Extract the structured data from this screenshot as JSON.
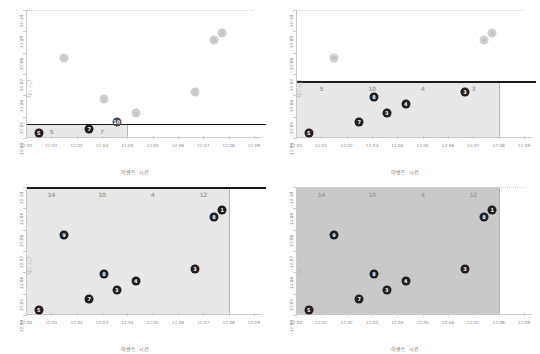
{
  "figure": {
    "panel_count": 4,
    "xlabel": "이벤트 시간",
    "ylabel": "처리 시간",
    "x_ticks": [
      "12:00",
      "12:01",
      "12:02",
      "12:03",
      "12:04",
      "12:05",
      "12:06",
      "12:07",
      "12:08",
      "12:09"
    ],
    "y_ticks": [
      "12:04",
      "12:05",
      "12:06",
      "12:07",
      "12:08",
      "12:09",
      "12:10"
    ],
    "group_labels": [
      "14",
      "10",
      "4",
      "12"
    ],
    "group_labels_partial": [
      "5",
      "10",
      "4",
      "3"
    ],
    "group_labels_tl": [
      "5",
      "7"
    ]
  },
  "chart_data": [
    {
      "type": "scatter",
      "panel": "top-left",
      "title": "",
      "xlabel": "이벤트 시간",
      "ylabel": "처리 시간",
      "xlim": [
        "12:00",
        "12:09"
      ],
      "ylim": [
        "12:04",
        "12:10"
      ],
      "xticklabels": [
        "12:00",
        "12:01",
        "12:02",
        "12:03",
        "12:04",
        "12:05",
        "12:06",
        "12:07",
        "12:08",
        "12:09"
      ],
      "yticklabels": [
        "12:04",
        "12:05",
        "12:06",
        "12:07",
        "12:08",
        "12:09",
        "12:10"
      ],
      "grid": false,
      "legend": "none",
      "threshold_line": {
        "y": "12:04:40",
        "color": "#1a1a1a",
        "label": ""
      },
      "shaded_groups": [
        {
          "x_start": "12:00",
          "x_end": "12:02",
          "label": "5",
          "style": "light"
        },
        {
          "x_start": "12:02",
          "x_end": "12:04",
          "label": "7",
          "style": "light"
        }
      ],
      "points": [
        {
          "label": "5",
          "x": "12:00:30",
          "y": "12:04:15",
          "state": "dark"
        },
        {
          "label": "7",
          "x": "12:02:30",
          "y": "12:04:25",
          "state": "dark"
        },
        {
          "label": "10",
          "x": "12:03:35",
          "y": "12:04:45",
          "state": "mid"
        },
        {
          "label": "4",
          "x": "12:04:20",
          "y": "12:05:10",
          "state": "faint"
        },
        {
          "label": "8",
          "x": "12:03:05",
          "y": "12:05:50",
          "state": "faint"
        },
        {
          "label": "9",
          "x": "12:01:30",
          "y": "12:07:45",
          "state": "faint"
        },
        {
          "label": "3",
          "x": "12:06:40",
          "y": "12:06:10",
          "state": "faint"
        },
        {
          "label": "8",
          "x": "12:07:25",
          "y": "12:08:35",
          "state": "faint"
        },
        {
          "label": "1",
          "x": "12:07:45",
          "y": "12:08:55",
          "state": "faint"
        }
      ]
    },
    {
      "type": "scatter",
      "panel": "top-right",
      "title": "",
      "xlabel": "이벤트 시간",
      "ylabel": "처리 시간",
      "xlim": [
        "12:00",
        "12:09"
      ],
      "ylim": [
        "12:04",
        "12:10"
      ],
      "xticklabels": [
        "12:00",
        "12:01",
        "12:02",
        "12:03",
        "12:04",
        "12:05",
        "12:06",
        "12:07",
        "12:08",
        "12:09"
      ],
      "yticklabels": [
        "12:04",
        "12:05",
        "12:06",
        "12:07",
        "12:08",
        "12:09",
        "12:10"
      ],
      "grid": false,
      "legend": "none",
      "threshold_line": {
        "y": "12:06:40",
        "color": "#1a1a1a",
        "label": ""
      },
      "shaded_groups": [
        {
          "x_start": "12:00",
          "x_end": "12:02",
          "label": "5",
          "style": "light"
        },
        {
          "x_start": "12:02",
          "x_end": "12:04",
          "label": "10",
          "style": "light"
        },
        {
          "x_start": "12:04",
          "x_end": "12:06",
          "label": "4",
          "style": "light"
        },
        {
          "x_start": "12:06",
          "x_end": "12:08",
          "label": "3",
          "style": "light"
        }
      ],
      "points": [
        {
          "label": "5",
          "x": "12:00:30",
          "y": "12:04:15",
          "state": "dark"
        },
        {
          "label": "7",
          "x": "12:02:30",
          "y": "12:04:45",
          "state": "dark"
        },
        {
          "label": "3",
          "x": "12:03:35",
          "y": "12:05:10",
          "state": "dark"
        },
        {
          "label": "4",
          "x": "12:04:20",
          "y": "12:05:35",
          "state": "dark"
        },
        {
          "label": "8",
          "x": "12:03:05",
          "y": "12:05:55",
          "state": "dark"
        },
        {
          "label": "3",
          "x": "12:06:40",
          "y": "12:06:10",
          "state": "dark"
        },
        {
          "label": "9",
          "x": "12:01:30",
          "y": "12:07:45",
          "state": "faint"
        },
        {
          "label": "8",
          "x": "12:07:25",
          "y": "12:08:35",
          "state": "faint"
        },
        {
          "label": "1",
          "x": "12:07:45",
          "y": "12:08:55",
          "state": "faint"
        }
      ]
    },
    {
      "type": "scatter",
      "panel": "bottom-left",
      "title": "",
      "xlabel": "이벤트 시간",
      "ylabel": "처리 시간",
      "xlim": [
        "12:00",
        "12:09"
      ],
      "ylim": [
        "12:04",
        "12:10"
      ],
      "xticklabels": [
        "12:00",
        "12:01",
        "12:02",
        "12:03",
        "12:04",
        "12:05",
        "12:06",
        "12:07",
        "12:08",
        "12:09"
      ],
      "yticklabels": [
        "12:04",
        "12:05",
        "12:06",
        "12:07",
        "12:08",
        "12:09",
        "12:10"
      ],
      "grid": false,
      "legend": "none",
      "threshold_line": {
        "y": "12:10:00",
        "color": "#1a1a1a",
        "label": ""
      },
      "shaded_groups": [
        {
          "x_start": "12:00",
          "x_end": "12:02",
          "label": "14",
          "style": "light"
        },
        {
          "x_start": "12:02",
          "x_end": "12:04",
          "label": "10",
          "style": "light"
        },
        {
          "x_start": "12:04",
          "x_end": "12:06",
          "label": "4",
          "style": "light"
        },
        {
          "x_start": "12:06",
          "x_end": "12:08",
          "label": "12",
          "style": "light"
        }
      ],
      "points": [
        {
          "label": "5",
          "x": "12:00:30",
          "y": "12:04:15",
          "state": "dark"
        },
        {
          "label": "7",
          "x": "12:02:30",
          "y": "12:04:45",
          "state": "dark"
        },
        {
          "label": "3",
          "x": "12:03:35",
          "y": "12:05:10",
          "state": "dark"
        },
        {
          "label": "4",
          "x": "12:04:20",
          "y": "12:05:35",
          "state": "dark"
        },
        {
          "label": "8",
          "x": "12:03:05",
          "y": "12:05:55",
          "state": "dark"
        },
        {
          "label": "3",
          "x": "12:06:40",
          "y": "12:06:10",
          "state": "dark"
        },
        {
          "label": "9",
          "x": "12:01:30",
          "y": "12:07:45",
          "state": "dark"
        },
        {
          "label": "8",
          "x": "12:07:25",
          "y": "12:08:35",
          "state": "dark"
        },
        {
          "label": "1",
          "x": "12:07:45",
          "y": "12:08:55",
          "state": "dark"
        }
      ]
    },
    {
      "type": "scatter",
      "panel": "bottom-right",
      "title": "",
      "xlabel": "이벤트 시간",
      "ylabel": "처리 시간",
      "xlim": [
        "12:00",
        "12:09"
      ],
      "ylim": [
        "12:04",
        "12:10"
      ],
      "xticklabels": [
        "12:00",
        "12:01",
        "12:02",
        "12:03",
        "12:04",
        "12:05",
        "12:06",
        "12:07",
        "12:08",
        "12:09"
      ],
      "yticklabels": [
        "12:04",
        "12:05",
        "12:06",
        "12:07",
        "12:08",
        "12:09",
        "12:10"
      ],
      "grid": false,
      "legend": "none",
      "threshold_line": null,
      "shaded_groups": [
        {
          "x_start": "12:00",
          "x_end": "12:02",
          "label": "14",
          "style": "strong"
        },
        {
          "x_start": "12:02",
          "x_end": "12:04",
          "label": "10",
          "style": "strong"
        },
        {
          "x_start": "12:04",
          "x_end": "12:06",
          "label": "4",
          "style": "strong"
        },
        {
          "x_start": "12:06",
          "x_end": "12:08",
          "label": "12",
          "style": "strong"
        }
      ],
      "points": [
        {
          "label": "5",
          "x": "12:00:30",
          "y": "12:04:15",
          "state": "dark"
        },
        {
          "label": "7",
          "x": "12:02:30",
          "y": "12:04:45",
          "state": "dark"
        },
        {
          "label": "3",
          "x": "12:03:35",
          "y": "12:05:10",
          "state": "dark"
        },
        {
          "label": "4",
          "x": "12:04:20",
          "y": "12:05:35",
          "state": "dark"
        },
        {
          "label": "8",
          "x": "12:03:05",
          "y": "12:05:55",
          "state": "dark"
        },
        {
          "label": "3",
          "x": "12:06:40",
          "y": "12:06:10",
          "state": "dark"
        },
        {
          "label": "9",
          "x": "12:01:30",
          "y": "12:07:45",
          "state": "dark"
        },
        {
          "label": "8",
          "x": "12:07:25",
          "y": "12:08:35",
          "state": "dark"
        },
        {
          "label": "1",
          "x": "12:07:45",
          "y": "12:08:55",
          "state": "dark"
        }
      ]
    }
  ]
}
